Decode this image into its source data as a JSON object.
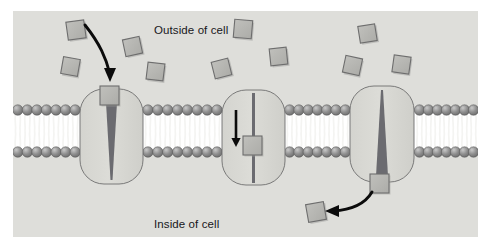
{
  "figure": {
    "background_color": "#ffffff",
    "panel_color": "#dededa",
    "panel": {
      "x": 13,
      "y": 11,
      "width": 465,
      "height": 226
    }
  },
  "labels": {
    "outside": "Outside of cell",
    "inside": "Inside of cell",
    "text_color": "#17171a",
    "font_size_px": 11.5
  },
  "membrane": {
    "name": "phospholipid-bilayer",
    "head_color": "#8a8a8a",
    "head_highlight": "#c9c9c9",
    "head_outline": "#5a5a5a",
    "tail_color": "#f4f4f2",
    "core_color": "#ffffff",
    "top_head_center_y": 110,
    "bottom_head_center_y": 152,
    "head_radius": 5.2,
    "lipid_spacing": 9.3,
    "segments": [
      {
        "name": "left-segment",
        "x_start": 13,
        "x_end": 80
      },
      {
        "name": "between-1-and-2",
        "x_start": 143,
        "x_end": 222
      },
      {
        "name": "between-2-and-3",
        "x_start": 285,
        "x_end": 350
      },
      {
        "name": "right-segment",
        "x_start": 415,
        "x_end": 478
      }
    ]
  },
  "proteins": [
    {
      "name": "transport-protein-1",
      "state": "open-outward",
      "body": {
        "x": 80,
        "y": 89,
        "width": 63,
        "height": 95,
        "rx": 24
      },
      "fill": "#d9d9d4",
      "outline": "#6e6e6e",
      "channel": {
        "shape": "funnel-narrowing-downward",
        "color": "#6b6b70",
        "top_width": 12,
        "bottom_width": 2,
        "top_y": 94,
        "bottom_y": 180
      },
      "solute": {
        "x": 100,
        "y": 86,
        "size": 19,
        "position": "entry-mouth-outside"
      }
    },
    {
      "name": "transport-protein-2",
      "state": "occluded-transit",
      "body": {
        "x": 222,
        "y": 90,
        "width": 63,
        "height": 95,
        "rx": 24
      },
      "fill": "#d9d9d4",
      "outline": "#6e6e6e",
      "channel": {
        "shape": "straight-narrow-pore",
        "color": "#6b6b70",
        "top_width": 3,
        "bottom_width": 3,
        "top_y": 93,
        "bottom_y": 183
      },
      "solute": {
        "x": 243,
        "y": 136,
        "size": 19,
        "position": "mid-channel"
      },
      "arrow": {
        "name": "transit-arrow",
        "direction": "down",
        "x": 236,
        "y1": 110,
        "y2": 147
      }
    },
    {
      "name": "transport-protein-3",
      "state": "open-inward",
      "body": {
        "x": 350,
        "y": 86,
        "width": 64,
        "height": 96,
        "rx": 24
      },
      "fill": "#d9d9d4",
      "outline": "#6e6e6e",
      "channel": {
        "shape": "funnel-narrowing-upward",
        "color": "#6b6b70",
        "top_width": 2,
        "bottom_width": 12,
        "top_y": 90,
        "bottom_y": 176
      },
      "solute": {
        "x": 370,
        "y": 174,
        "size": 19,
        "position": "exit-mouth-inside"
      }
    }
  ],
  "solutes": {
    "name": "solute-particles",
    "fill": "#b6b6b2",
    "outline": "#6d6d6d",
    "shadow": "#a3a3a0",
    "outside_particles": [
      {
        "x": 67,
        "y": 21,
        "size": 18,
        "rotation": -8
      },
      {
        "x": 62,
        "y": 58,
        "size": 17,
        "rotation": 10
      },
      {
        "x": 124,
        "y": 38,
        "size": 17,
        "rotation": -12
      },
      {
        "x": 147,
        "y": 63,
        "size": 17,
        "rotation": 7
      },
      {
        "x": 213,
        "y": 60,
        "size": 17,
        "rotation": -14
      },
      {
        "x": 234,
        "y": 20,
        "size": 18,
        "rotation": 5
      },
      {
        "x": 270,
        "y": 48,
        "size": 17,
        "rotation": -6
      },
      {
        "x": 344,
        "y": 57,
        "size": 17,
        "rotation": 12
      },
      {
        "x": 359,
        "y": 25,
        "size": 17,
        "rotation": -9
      },
      {
        "x": 393,
        "y": 56,
        "size": 17,
        "rotation": 8
      }
    ],
    "inside_particles": [
      {
        "x": 307,
        "y": 203,
        "size": 18,
        "rotation": -10
      }
    ]
  },
  "arrows": [
    {
      "name": "entry-arrow",
      "description": "curved arrow from outside into protein 1",
      "color": "#0b0b0b",
      "path": "M 85 25 C 100 44, 106 58, 110 74",
      "head": "M 110 82 L 104 68 L 116 68 Z"
    },
    {
      "name": "exit-arrow",
      "description": "curved arrow from protein 3 exit toward inside of cell",
      "color": "#0b0b0b",
      "path": "M 372 192 C 365 204, 350 210, 333 211",
      "head": "M 325 211 L 339 205 L 339 217 Z"
    }
  ]
}
